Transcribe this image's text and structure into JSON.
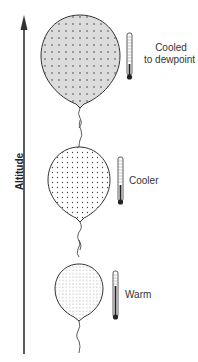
{
  "axis": {
    "label": "Altitude",
    "direction": "up"
  },
  "balloons": [
    {
      "id": "top",
      "state": "cooled-to-dewpoint",
      "label_line1": "Cooled",
      "label_line2": "to dewpoint",
      "fill": "#dcdcdc",
      "dot_color": "#444444",
      "thermometer_level": 0.25
    },
    {
      "id": "middle",
      "state": "cooler",
      "label_line1": "Cooler",
      "fill": "#ffffff",
      "dot_color": "#444444",
      "thermometer_level": 0.45
    },
    {
      "id": "bottom",
      "state": "warm",
      "label_line1": "Warm",
      "fill": "#ffffff",
      "dot_color": "#666666",
      "thermometer_level": 0.75
    }
  ],
  "colors": {
    "line": "#333333",
    "text": "#333333"
  }
}
